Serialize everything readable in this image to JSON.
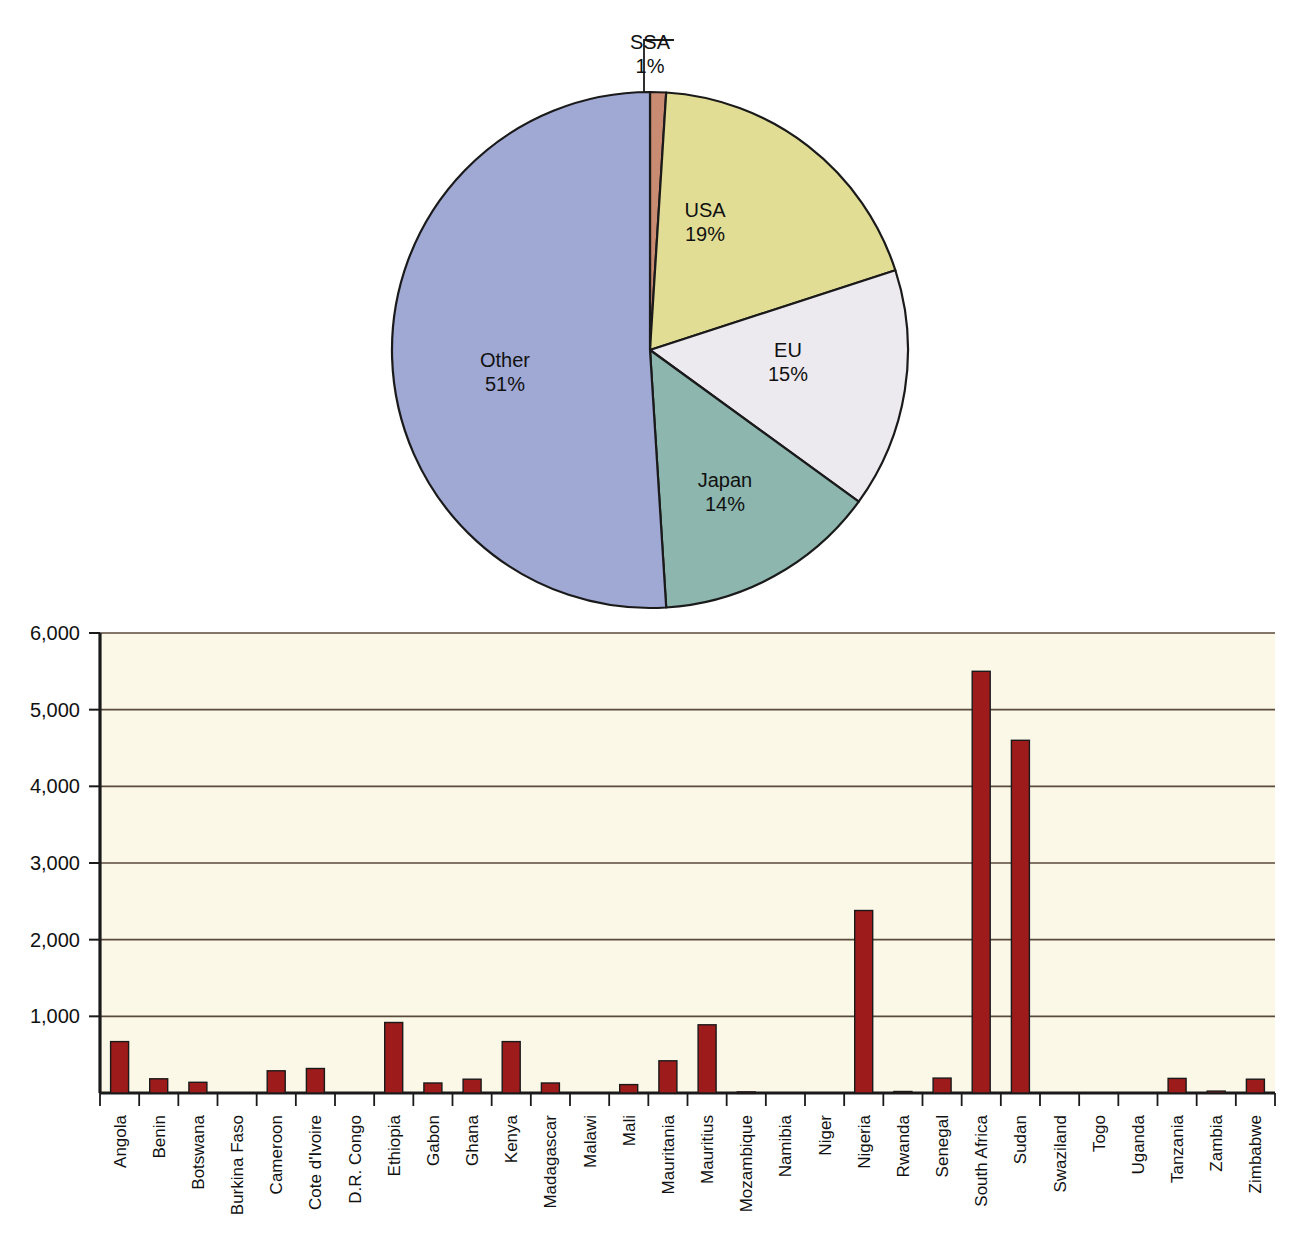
{
  "chart_data": [
    {
      "type": "pie",
      "title": "",
      "legend_position": "inside-slices",
      "categories": [
        "SSA",
        "USA",
        "EU",
        "Japan",
        "Other"
      ],
      "values": [
        1,
        19,
        15,
        14,
        51
      ],
      "value_labels": [
        "1%",
        "19%",
        "15%",
        "14%",
        "51%"
      ],
      "colors": [
        "#c98b72",
        "#e2dd95",
        "#ece9ef",
        "#8cb6ae",
        "#a0a9d4"
      ],
      "start_angle_deg": -90,
      "direction": "clockwise",
      "annotations": [
        {
          "text": "SSA",
          "note": "label with leader line pointing to the thin 1% slice at top"
        }
      ]
    },
    {
      "type": "bar",
      "title": "",
      "xlabel": "",
      "ylabel": "",
      "ylim": [
        0,
        6000
      ],
      "ytick_values": [
        0,
        1000,
        2000,
        3000,
        4000,
        5000,
        6000
      ],
      "ytick_labels": [
        "0",
        "1,000",
        "2,000",
        "3,000",
        "4,000",
        "5,000",
        "6,000"
      ],
      "grid": true,
      "grid_axis": "y",
      "bar_color": "#9e1b1b",
      "plot_background": "#fbf8e8",
      "xtick_rotation_deg": -90,
      "categories": [
        "Angola",
        "Benin",
        "Botswana",
        "Burkina Faso",
        "Cameroon",
        "Cote d'Ivoire",
        "D.R. Congo",
        "Ethiopia",
        "Gabon",
        "Ghana",
        "Kenya",
        "Madagascar",
        "Malawi",
        "Mali",
        "Mauritania",
        "Mauritius",
        "Mozambique",
        "Namibia",
        "Niger",
        "Nigeria",
        "Rwanda",
        "Senegal",
        "South Africa",
        "Sudan",
        "Swaziland",
        "Togo",
        "Uganda",
        "Tanzania",
        "Zambia",
        "Zimbabwe"
      ],
      "values": [
        670,
        185,
        140,
        0,
        290,
        320,
        0,
        920,
        130,
        180,
        670,
        130,
        0,
        110,
        420,
        890,
        15,
        0,
        0,
        2380,
        20,
        195,
        5500,
        4600,
        0,
        0,
        0,
        190,
        25,
        180
      ]
    }
  ]
}
